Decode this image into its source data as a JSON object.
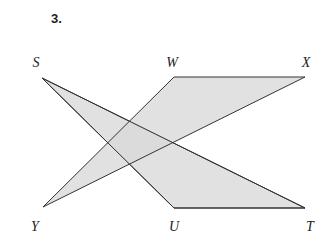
{
  "problem_number": "3.",
  "fill_color": "#d9d9d9",
  "stroke_color": "#333333",
  "points": {
    "S": {
      "label": "S",
      "x": 42,
      "y": 78
    },
    "W": {
      "label": "W",
      "x": 174,
      "y": 77
    },
    "X": {
      "label": "X",
      "x": 305,
      "y": 77
    },
    "Y": {
      "label": "Y",
      "x": 43,
      "y": 207
    },
    "U": {
      "label": "U",
      "x": 174,
      "y": 208
    },
    "T": {
      "label": "T",
      "x": 305,
      "y": 208
    }
  },
  "triangles": [
    {
      "name": "SUT",
      "vertices": [
        "S",
        "U",
        "T"
      ]
    },
    {
      "name": "YWX",
      "vertices": [
        "Y",
        "W",
        "X"
      ]
    }
  ]
}
